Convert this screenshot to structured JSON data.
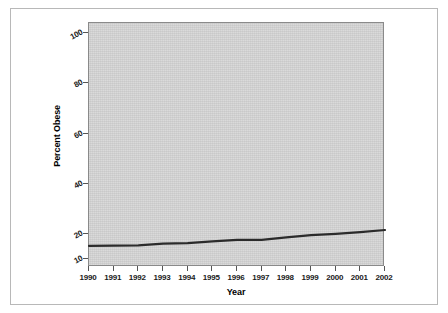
{
  "chart_data": {
    "type": "line",
    "title": "",
    "xlabel": "Year",
    "ylabel": "Percent Obese",
    "x": [
      1990,
      1991,
      1992,
      1993,
      1994,
      1995,
      1996,
      1997,
      1998,
      1999,
      2000,
      2001,
      2002
    ],
    "categories": [
      "1990",
      "1991",
      "1992",
      "1993",
      "1994",
      "1995",
      "1996",
      "1997",
      "1998",
      "1999",
      "2000",
      "2001",
      "2002"
    ],
    "values": [
      15.4,
      15.5,
      15.6,
      16.3,
      16.5,
      17.2,
      17.8,
      17.8,
      18.8,
      19.7,
      20.2,
      20.9,
      21.7
    ],
    "series": [
      {
        "name": "Percent Obese",
        "values": [
          15.4,
          15.5,
          15.6,
          16.3,
          16.5,
          17.2,
          17.8,
          17.8,
          18.8,
          19.7,
          20.2,
          20.9,
          21.7
        ],
        "color": "#2b2b2b"
      }
    ],
    "xlim": [
      1990,
      2002
    ],
    "ylim": [
      7,
      104
    ],
    "ytick_labels": [
      "10",
      "20",
      "40",
      "60",
      "80",
      "100"
    ],
    "ytick_values": [
      10,
      20,
      40,
      60,
      80,
      100
    ],
    "xtick_labels": [
      "1990",
      "1991",
      "1992",
      "1993",
      "1994",
      "1995",
      "1996",
      "1997",
      "1998",
      "1999",
      "2000",
      "2001",
      "2002"
    ],
    "grid": false,
    "legend": false,
    "legend_position": "none",
    "plot_background_color": "#d4d4d4",
    "figure_background_color": "#ffffff",
    "line_color": "#2b2b2b",
    "axis_color": "#555555"
  }
}
